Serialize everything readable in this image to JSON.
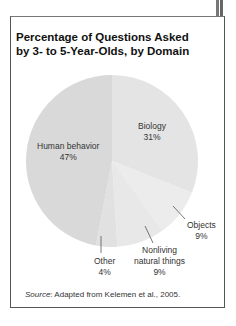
{
  "chart_data": {
    "type": "pie",
    "title": "Percentage of Questions Asked by 3- to 5-Year-Olds, by Domain",
    "title_lines": [
      "Percentage of Questions Asked",
      "by 3- to 5-Year-Olds, by Domain"
    ],
    "slices": [
      {
        "label": "Biology",
        "value": 31,
        "display": "31%",
        "color": "#e4e4e4"
      },
      {
        "label": "Objects",
        "value": 9,
        "display": "9%",
        "color": "#ececec"
      },
      {
        "label": "Nonliving natural things",
        "label_lines": [
          "Nonliving",
          "natural things"
        ],
        "value": 9,
        "display": "9%",
        "color": "#e8e8e8"
      },
      {
        "label": "Other",
        "value": 4,
        "display": "4%",
        "color": "#e1e1e1"
      },
      {
        "label": "Human behavior",
        "value": 47,
        "display": "47%",
        "color": "#d9d9d9"
      }
    ],
    "start_angle_deg": 0,
    "direction": "clockwise"
  },
  "source": {
    "prefix": "Source",
    "text": ": Adapted from Kelemen et al., 2005."
  }
}
